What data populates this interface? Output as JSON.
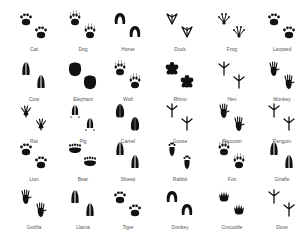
{
  "colors": {
    "ink": "#111111",
    "label": "#555555",
    "background": "#ffffff"
  },
  "grid": {
    "columns_x": [
      9,
      58,
      103,
      155,
      207,
      257
    ],
    "rows_y": [
      8,
      58,
      100,
      138,
      186
    ]
  },
  "animals": [
    {
      "name": "Cat",
      "icon": "paw-icon"
    },
    {
      "name": "Dog",
      "icon": "paw-claws-icon"
    },
    {
      "name": "Horse",
      "icon": "hoof-horseshoe-icon"
    },
    {
      "name": "Duck",
      "icon": "webbed-foot-icon"
    },
    {
      "name": "Frog",
      "icon": "frog-foot-icon"
    },
    {
      "name": "Leopard",
      "icon": "paw-icon"
    },
    {
      "name": "Cow",
      "icon": "cloven-hoof-icon"
    },
    {
      "name": "Elephant",
      "icon": "round-pad-icon"
    },
    {
      "name": "Wolf",
      "icon": "paw-claws-icon"
    },
    {
      "name": "Rhino",
      "icon": "three-toe-pad-icon"
    },
    {
      "name": "Hen",
      "icon": "bird-foot-icon"
    },
    {
      "name": "Monkey",
      "icon": "hand-foot-icon"
    },
    {
      "name": "Rat",
      "icon": "rodent-foot-icon"
    },
    {
      "name": "Pig",
      "icon": "cloven-hoof-dewclaw-icon"
    },
    {
      "name": "Camel",
      "icon": "oval-pad-icon"
    },
    {
      "name": "Goose",
      "icon": "bird-foot-icon"
    },
    {
      "name": "Raccoon",
      "icon": "hand-foot-icon"
    },
    {
      "name": "Penguin",
      "icon": "bird-foot-icon"
    },
    {
      "name": "Lion",
      "icon": "paw-icon"
    },
    {
      "name": "Bear",
      "icon": "bear-paw-icon"
    },
    {
      "name": "Sheep",
      "icon": "cloven-hoof-icon"
    },
    {
      "name": "Rabbit",
      "icon": "long-paw-icon"
    },
    {
      "name": "Fox",
      "icon": "paw-claws-icon"
    },
    {
      "name": "Giraffe",
      "icon": "cloven-hoof-icon"
    },
    {
      "name": "Gorilla",
      "icon": "hand-foot-icon"
    },
    {
      "name": "Llama",
      "icon": "cloven-hoof-icon"
    },
    {
      "name": "Tiger",
      "icon": "paw-icon"
    },
    {
      "name": "Donkey",
      "icon": "hoof-horseshoe-icon"
    },
    {
      "name": "Crocodile",
      "icon": "crocodile-foot-icon"
    },
    {
      "name": "Dove",
      "icon": "bird-foot-icon"
    }
  ]
}
